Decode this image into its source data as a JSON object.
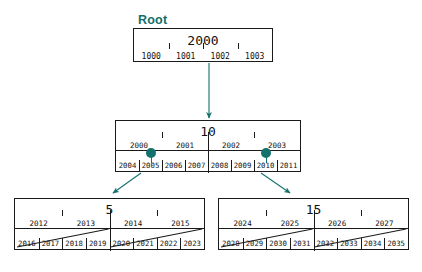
{
  "diagram": {
    "title_label": "Root",
    "type": "b-tree-index-diagram",
    "accent_color": "#14726c",
    "line_color": "#1a1a1a",
    "background": "#ffffff"
  },
  "root_node": {
    "name": "root-node",
    "key": "2000",
    "pointers": [
      "1000",
      "1001",
      "1002",
      "1003"
    ]
  },
  "internal_node": {
    "name": "internal-node-10",
    "key": "10",
    "keys_row": [
      "2000",
      "2001",
      "2002",
      "2003"
    ],
    "pointers": [
      "2004",
      "2005",
      "2006",
      "2007",
      "2008",
      "2009",
      "2010",
      "2011"
    ],
    "pointer_dots": [
      "2005",
      "2010"
    ]
  },
  "leaf_left": {
    "name": "leaf-node-5",
    "key": "5",
    "keys_row": [
      "2012",
      "2013",
      "2014",
      "2015"
    ],
    "pointers": [
      "2016",
      "2017",
      "2018",
      "2019",
      "2020",
      "2021",
      "2022",
      "2023"
    ]
  },
  "leaf_right": {
    "name": "leaf-node-15",
    "key": "15",
    "keys_row": [
      "2024",
      "2025",
      "2026",
      "2027"
    ],
    "pointers": [
      "2028",
      "2029",
      "2030",
      "2031",
      "2032",
      "2033",
      "2034",
      "2035"
    ]
  },
  "edges": [
    {
      "name": "edge-root-to-10",
      "from": "root-node",
      "to": "internal-node-10"
    },
    {
      "name": "edge-10-to-5",
      "from": "internal-node-10",
      "to": "leaf-node-5"
    },
    {
      "name": "edge-10-to-15",
      "from": "internal-node-10",
      "to": "leaf-node-15"
    }
  ]
}
